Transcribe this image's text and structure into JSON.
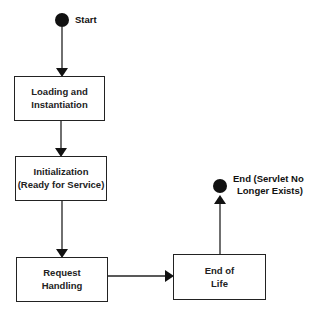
{
  "diagram": {
    "type": "state-flow",
    "start": {
      "label": "Start"
    },
    "end": {
      "label_line1": "End (Servlet No",
      "label_line2": "Longer Exists)"
    },
    "nodes": [
      {
        "id": "loading",
        "line1": "Loading and",
        "line2": "Instantiation"
      },
      {
        "id": "init",
        "line1": "Initialization",
        "line2": "(Ready for Service)"
      },
      {
        "id": "request",
        "line1": "Request",
        "line2": "Handling"
      },
      {
        "id": "eol",
        "line1": "End of",
        "line2": "Life"
      }
    ],
    "edges": [
      {
        "from": "start",
        "to": "loading"
      },
      {
        "from": "loading",
        "to": "init"
      },
      {
        "from": "init",
        "to": "request"
      },
      {
        "from": "request",
        "to": "eol"
      },
      {
        "from": "eol",
        "to": "end"
      }
    ],
    "colors": {
      "stroke": "#222222",
      "fill": "#ffffff",
      "terminal": "#111111"
    }
  }
}
